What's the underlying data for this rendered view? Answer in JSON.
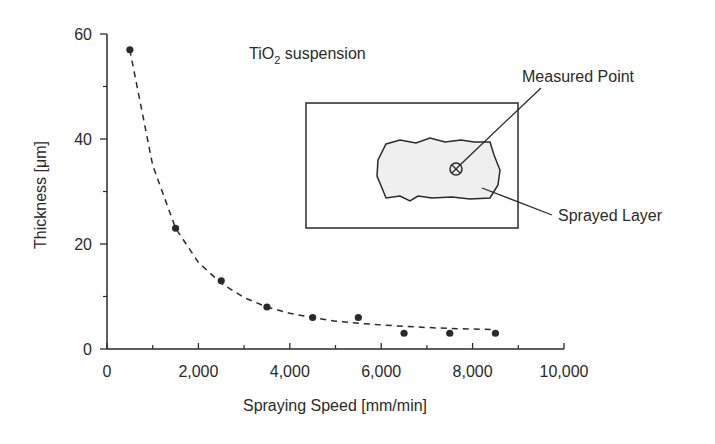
{
  "chart_data": {
    "type": "scatter",
    "title": "",
    "xlabel": "Spraying Speed [mm/min]",
    "ylabel": "Thickness [μm]",
    "xlim": [
      0,
      10000
    ],
    "ylim": [
      0,
      60
    ],
    "x_ticks": [
      0,
      2000,
      4000,
      6000,
      8000,
      10000
    ],
    "x_tick_labels": [
      "0",
      "2,000",
      "4,000",
      "6,000",
      "8,000",
      "10,000"
    ],
    "x_minor_ticks": [
      1000,
      3000,
      5000,
      7000,
      9000
    ],
    "y_ticks": [
      0,
      20,
      40,
      60
    ],
    "y_tick_labels": [
      "0",
      "20",
      "40",
      "60"
    ],
    "y_minor_ticks": [
      10,
      30,
      50
    ],
    "grid": false,
    "legend": null,
    "series": [
      {
        "name": "Measured thickness",
        "style": "filled-circle markers",
        "x": [
          500,
          1500,
          2500,
          3500,
          4500,
          5500,
          6500,
          7500,
          8500
        ],
        "y": [
          57,
          23,
          13,
          8,
          6,
          6,
          3,
          3,
          3
        ]
      },
      {
        "name": "Fitted curve",
        "style": "dashed line",
        "x": [
          500,
          1000,
          1500,
          2000,
          2500,
          3000,
          3500,
          4000,
          4500,
          5000,
          5500,
          6000,
          6500,
          7000,
          7500,
          8000,
          8500
        ],
        "y": [
          57,
          35,
          23,
          16.5,
          12.5,
          9.8,
          8,
          6.8,
          6,
          5.3,
          4.9,
          4.6,
          4.3,
          4.1,
          3.9,
          3.8,
          3.7
        ]
      }
    ],
    "annotations": [
      {
        "text": "TiO2 suspension",
        "position": "upper center"
      },
      {
        "text": "Measured Point",
        "position": "inset, pointing to circled-x marker"
      },
      {
        "text": "Sprayed Layer",
        "position": "inset, pointing to shaded blob"
      }
    ],
    "inset": {
      "description": "Rectangular substrate with irregular sprayed layer blob and a circled-X measured point"
    }
  },
  "labels": {
    "xlabel": "Spraying Speed [mm/min]",
    "ylabel": "Thickness [μm]",
    "suspension_prefix": "TiO",
    "suspension_sub": "2",
    "suspension_suffix": " suspension",
    "measured_point": "Measured Point",
    "sprayed_layer": "Sprayed Layer"
  },
  "colors": {
    "ink": "#2a2a2a",
    "blob_fill": "#efefef",
    "background": "#ffffff"
  }
}
